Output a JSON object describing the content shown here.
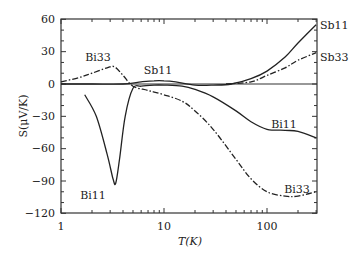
{
  "chart_data": {
    "type": "line",
    "title": "",
    "xlabel": "T(K)",
    "ylabel": "S(μV/K)",
    "xscale": "log",
    "xlim": [
      1,
      300
    ],
    "ylim": [
      -120,
      60
    ],
    "xticks": [
      "1",
      "10",
      "100"
    ],
    "yticks": [
      "60",
      "30",
      "0",
      "-30",
      "-60",
      "-90",
      "-120"
    ],
    "grid": false,
    "series": [
      {
        "name": "Sb11",
        "style": "solid",
        "x": [
          1,
          2,
          4,
          6,
          8,
          10,
          13,
          20,
          30,
          45,
          70,
          100,
          150,
          200,
          300
        ],
        "y": [
          0,
          0,
          0,
          2,
          3,
          3,
          2,
          -1,
          -1,
          0,
          5,
          12,
          25,
          38,
          55
        ]
      },
      {
        "name": "Sb33",
        "style": "dashdot",
        "x": [
          40,
          70,
          100,
          150,
          200,
          300
        ],
        "y": [
          0,
          2,
          8,
          15,
          22,
          29
        ]
      },
      {
        "name": "Bi11",
        "style": "solid",
        "x": [
          1.7,
          2.2,
          2.8,
          3.2,
          3.4,
          3.7,
          4.2,
          5,
          6,
          8,
          10,
          15,
          20,
          30,
          50,
          70,
          100,
          150,
          200,
          300
        ],
        "y": [
          -10,
          -30,
          -65,
          -88,
          -92,
          -70,
          -30,
          -4,
          -2,
          -1,
          -1,
          -2,
          -5,
          -12,
          -25,
          -35,
          -42,
          -43,
          -44,
          -50
        ]
      },
      {
        "name": "Bi33",
        "style": "dashdot",
        "x": [
          1,
          1.5,
          2,
          2.8,
          3.3,
          4,
          5,
          7,
          10,
          15,
          20,
          30,
          50,
          70,
          100,
          150,
          200,
          300
        ],
        "y": [
          2,
          6,
          10,
          15,
          16,
          8,
          -2,
          -6,
          -10,
          -16,
          -25,
          -42,
          -70,
          -88,
          -100,
          -104,
          -104,
          -100
        ]
      }
    ],
    "annotations": [
      {
        "text": "Bi33",
        "x": 2.5,
        "y": 22
      },
      {
        "text": "Sb11",
        "x": 9,
        "y": 10
      },
      {
        "text": "Bi11",
        "x": 3.3,
        "y": -106
      },
      {
        "text": "Bi11",
        "x": 150,
        "y": -38
      },
      {
        "text": "Bi33",
        "x": 130,
        "y": -95
      },
      {
        "text": "Sb11",
        "x": 350,
        "y": 54
      },
      {
        "text": "Sb33",
        "x": 350,
        "y": 28
      }
    ]
  },
  "labels": {
    "xlabel": "T(K)",
    "ylabel": "S(μV/K)",
    "xt1": "1",
    "xt10": "10",
    "xt100": "100",
    "y60": "60",
    "y30": "30",
    "y0": "0",
    "ym30": "−30",
    "ym60": "−60",
    "ym90": "−90",
    "ym120": "−120",
    "a_bi33_top": "Bi33",
    "a_sb11_mid": "Sb11",
    "a_bi11_dip": "Bi11",
    "a_bi11_right": "Bi11",
    "a_bi33_right": "Bi33",
    "a_sb11_right": "Sb11",
    "a_sb33_right": "Sb33"
  }
}
